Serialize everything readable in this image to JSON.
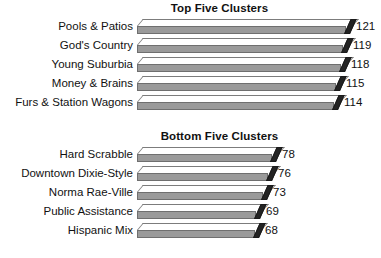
{
  "chart_data": [
    {
      "type": "bar",
      "orientation": "horizontal",
      "style": "3d-bar",
      "title": "Top Five Clusters",
      "xlabel": "",
      "ylabel": "",
      "grid": false,
      "legend": null,
      "show_value_labels": true,
      "xlim": [
        0,
        121
      ],
      "categories": [
        "Pools & Patios",
        "God's Country",
        "Young Suburbia",
        "Money & Brains",
        "Furs & Station Wagons"
      ],
      "values": [
        121,
        119,
        118,
        115,
        114
      ],
      "value_labels": [
        "121",
        "119",
        "118",
        "115",
        "114"
      ]
    },
    {
      "type": "bar",
      "orientation": "horizontal",
      "style": "3d-bar",
      "title": "Bottom Five Clusters",
      "xlabel": "",
      "ylabel": "",
      "grid": false,
      "legend": null,
      "show_value_labels": true,
      "xlim": [
        0,
        121
      ],
      "categories": [
        "Hard Scrabble",
        "Downtown Dixie-Style",
        "Norma Rae-Ville",
        "Public Assistance",
        "Hispanic Mix"
      ],
      "values": [
        78,
        76,
        73,
        69,
        68
      ],
      "value_labels": [
        "78",
        "76",
        "73",
        "69",
        "68"
      ]
    }
  ],
  "colors": {
    "background": "#ffffff",
    "bar_top_face": "#ffffff",
    "bar_front_face": "#9a9a9a",
    "bar_end_cap": "#232323",
    "bar_outline": "#6f6f6f",
    "text": "#111111"
  }
}
